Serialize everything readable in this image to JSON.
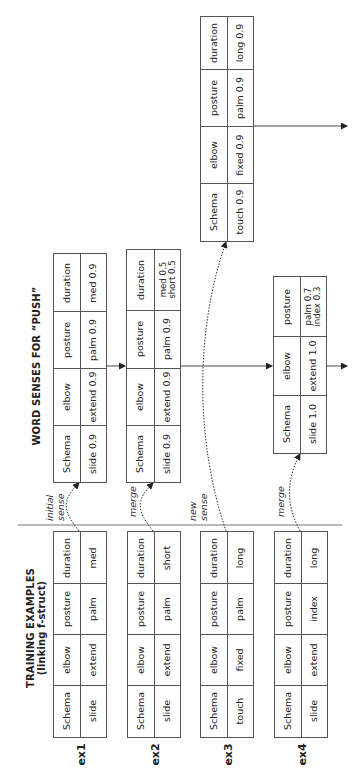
{
  "titles": {
    "training": [
      "TRAINING EXAMPLES",
      "(linking f-struct)"
    ],
    "senses": "WORD SENSES FOR “PUSH”"
  },
  "training_examples": [
    {
      "label": "ex1",
      "rows": [
        [
          "duration",
          "med"
        ],
        [
          "posture",
          "palm"
        ],
        [
          "elbow",
          "extend"
        ],
        [
          "Schema",
          "slide"
        ]
      ]
    },
    {
      "label": "ex2",
      "rows": [
        [
          "duration",
          "short"
        ],
        [
          "posture",
          "palm"
        ],
        [
          "elbow",
          "extend"
        ],
        [
          "Schema",
          "slide"
        ]
      ]
    },
    {
      "label": "ex3",
      "rows": [
        [
          "duration",
          "long"
        ],
        [
          "posture",
          "palm"
        ],
        [
          "elbow",
          "fixed"
        ],
        [
          "Schema",
          "touch"
        ]
      ]
    },
    {
      "label": "ex4",
      "rows": [
        [
          "duration",
          "long"
        ],
        [
          "posture",
          "index"
        ],
        [
          "elbow",
          "extend"
        ],
        [
          "Schema",
          "slide"
        ]
      ]
    }
  ],
  "word_senses": {
    "sense1": {
      "rows": [
        [
          "duration",
          "med 0.9"
        ],
        [
          "posture",
          "palm 0.9"
        ],
        [
          "elbow",
          "extend 0.9"
        ],
        [
          "Schema",
          "slide 0.9"
        ]
      ]
    },
    "sense2": {
      "rows": [
        [
          "duration",
          "med 0.5",
          "short 0.5"
        ],
        [
          "posture",
          "palm 0.9"
        ],
        [
          "elbow",
          "extend 0.9"
        ],
        [
          "Schema",
          "slide 0.9"
        ]
      ]
    },
    "sense3": {
      "rows": [
        [
          "duration",
          "long 0.9"
        ],
        [
          "posture",
          "palm 0.9"
        ],
        [
          "elbow",
          "fixed 0.9"
        ],
        [
          "Schema",
          "touch 0.9"
        ]
      ]
    },
    "sense4": {
      "rows": [
        [
          "posture",
          "palm 0.7",
          "index 0.3"
        ],
        [
          "elbow",
          "extend 1.0"
        ],
        [
          "Schema",
          "slide 1.0"
        ]
      ]
    }
  },
  "annotations": {
    "ex1": [
      "initial",
      "sense"
    ],
    "ex2": [
      "merge"
    ],
    "ex3": [
      "new",
      "sense"
    ],
    "ex4": [
      "merge"
    ]
  },
  "colors": {
    "line": "#555555",
    "text": "#222222",
    "background": "#ffffff"
  }
}
